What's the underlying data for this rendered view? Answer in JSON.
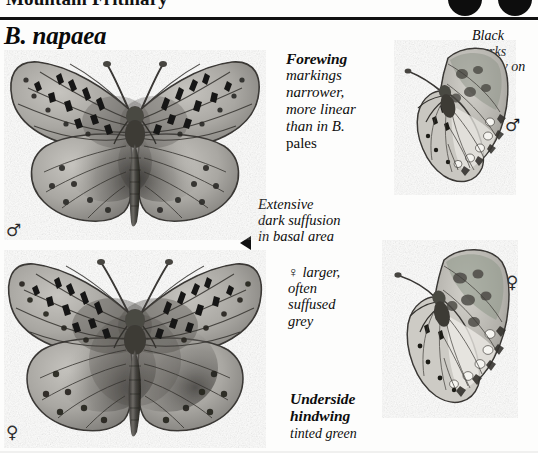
{
  "page": {
    "running_head": "Mountain Fritillary",
    "species_name": "B. napaea",
    "badges": [
      {
        "name": "status-dot-1",
        "color": "#0d0d0d"
      },
      {
        "name": "status-dot-2",
        "color": "#0d0d0d"
      }
    ]
  },
  "annotations": {
    "forewing": {
      "heading": "Forewing",
      "body_line1": "markings",
      "body_line2": "narrower,",
      "body_line3": "more linear",
      "body_line4": "than in B.",
      "body_line5": "pales"
    },
    "black_marks": {
      "line1": "Black",
      "line2": "marks",
      "line3": "scanty on",
      "line4": "fwing"
    },
    "dark_suffusion": {
      "line1": "Extensive",
      "line2": "dark suffusion",
      "line3": "in basal area"
    },
    "female_larger": {
      "line1": "♀ larger,",
      "line2": "often",
      "line3": "suffused",
      "line4": "grey"
    },
    "underside_hindwing": {
      "heading_line1": "Underside",
      "heading_line2": "hindwing",
      "body": "tinted green"
    }
  },
  "sex_symbols": {
    "male_upperside": "♂",
    "female_upperside": "♀",
    "male_underside": "♂",
    "female_underside": "♀"
  },
  "specimens": [
    {
      "name": "male-upperside",
      "sex": "♂",
      "view": "upperside",
      "caption": ""
    },
    {
      "name": "female-upperside",
      "sex": "♀",
      "view": "upperside",
      "caption": ""
    },
    {
      "name": "male-underside",
      "sex": "♂",
      "view": "underside",
      "caption": ""
    },
    {
      "name": "female-underside",
      "sex": "♀",
      "view": "underside",
      "caption": ""
    }
  ],
  "colors": {
    "ink": "#0d0d0d",
    "paper": "#fdfdfc",
    "wing_light": "#b9b7b2",
    "wing_mid": "#8e8c87",
    "wing_dark": "#54524e",
    "wing_darkest": "#2b2a28"
  }
}
